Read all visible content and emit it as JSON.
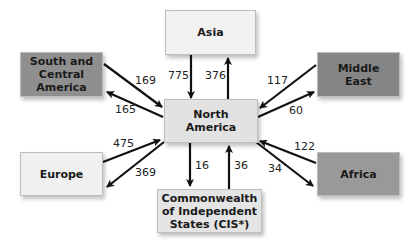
{
  "diagram": {
    "center": {
      "label": "North\nAmerica"
    },
    "regions": {
      "asia": {
        "label": "Asia",
        "color": "#f2f2f2"
      },
      "south_central_america": {
        "label": "South and\nCentral\nAmerica",
        "color": "#8f8f8f"
      },
      "middle_east": {
        "label": "Middle\nEast",
        "color": "#858585"
      },
      "europe": {
        "label": "Europe",
        "color": "#f0f0f0"
      },
      "cis": {
        "label": "Commonwealth\nof Independent\nStates (CIS*)",
        "color": "#e4e4e4"
      },
      "africa": {
        "label": "Africa",
        "color": "#999999"
      }
    },
    "center_color": "#e2e2e2",
    "flows": {
      "asia_to_na": "775",
      "na_to_asia": "376",
      "sca_to_na": "169",
      "na_to_sca": "165",
      "me_to_na": "117",
      "na_to_me": "60",
      "europe_to_na": "475",
      "na_to_europe": "369",
      "na_to_cis": "16",
      "cis_to_na": "36",
      "africa_to_na": "122",
      "na_to_africa": "34"
    }
  }
}
